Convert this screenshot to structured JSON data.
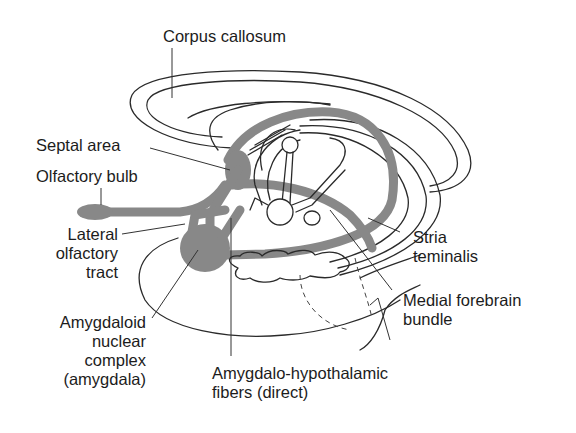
{
  "figure": {
    "colors": {
      "pathway_fill": "#888888",
      "line_ink": "#2a2a2a",
      "text": "#1c1c1c",
      "background": "#ffffff"
    },
    "labels": {
      "corpus_callosum": "Corpus callosum",
      "septal_area": "Septal area",
      "olfactory_bulb": "Olfactory bulb",
      "lateral_olfactory_tract": [
        "Lateral",
        "olfactory",
        "tract"
      ],
      "amygdala": [
        "Amygdaloid",
        "nuclear",
        "complex",
        "(amygdala)"
      ],
      "amygdalo_hypothalamic": [
        "Amygdalo-hypothalamic",
        "fibers (direct)"
      ],
      "stria_terminalis": [
        "Stria",
        "teminalis"
      ],
      "medial_forebrain_bundle": [
        "Medial forebrain",
        "bundle"
      ]
    }
  }
}
